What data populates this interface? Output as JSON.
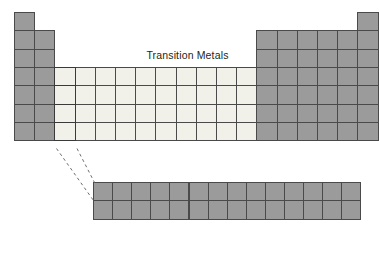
{
  "diagram": {
    "title": "Transition Metals",
    "title_x": 152,
    "title_y": 56,
    "type": "periodic-table-schematic"
  },
  "colors": {
    "main_block_fill": "#9b9b9b",
    "transition_block_fill": "#f1f1e9",
    "cell_border": "#4a4a4a",
    "group3_border": "#3a3a3a",
    "connector_line": "#6e6e6e",
    "background": "#ffffff",
    "title_text": "#231f20"
  },
  "geometry": {
    "main_origin_x": 14,
    "main_origin_y": 12,
    "cell_width": 20.2,
    "cell_height": 18.35,
    "f_block_origin_x": 93,
    "f_block_origin_y": 182,
    "f_block_cell_width": 19.1,
    "f_block_cell_height": 18.35
  },
  "main_table": {
    "columns": 18,
    "rows": 7,
    "column_extents": [
      {
        "group": 1,
        "start_row": 1,
        "end_row": 7,
        "fill": "gray"
      },
      {
        "group": 2,
        "start_row": 2,
        "end_row": 7,
        "fill": "gray"
      },
      {
        "group": 3,
        "start_row": 4,
        "end_row": 7,
        "fill": "light",
        "highlight": true
      },
      {
        "group": 4,
        "start_row": 4,
        "end_row": 7,
        "fill": "light"
      },
      {
        "group": 5,
        "start_row": 4,
        "end_row": 7,
        "fill": "light"
      },
      {
        "group": 6,
        "start_row": 4,
        "end_row": 7,
        "fill": "light"
      },
      {
        "group": 7,
        "start_row": 4,
        "end_row": 7,
        "fill": "light"
      },
      {
        "group": 8,
        "start_row": 4,
        "end_row": 7,
        "fill": "light"
      },
      {
        "group": 9,
        "start_row": 4,
        "end_row": 7,
        "fill": "light"
      },
      {
        "group": 10,
        "start_row": 4,
        "end_row": 7,
        "fill": "light"
      },
      {
        "group": 11,
        "start_row": 4,
        "end_row": 7,
        "fill": "light"
      },
      {
        "group": 12,
        "start_row": 4,
        "end_row": 7,
        "fill": "light"
      },
      {
        "group": 13,
        "start_row": 2,
        "end_row": 7,
        "fill": "gray"
      },
      {
        "group": 14,
        "start_row": 2,
        "end_row": 7,
        "fill": "gray"
      },
      {
        "group": 15,
        "start_row": 2,
        "end_row": 7,
        "fill": "gray"
      },
      {
        "group": 16,
        "start_row": 2,
        "end_row": 7,
        "fill": "gray"
      },
      {
        "group": 17,
        "start_row": 2,
        "end_row": 7,
        "fill": "gray"
      },
      {
        "group": 18,
        "start_row": 1,
        "end_row": 7,
        "fill": "gray"
      }
    ]
  },
  "f_block": {
    "columns": 14,
    "rows": 2,
    "fill": "gray"
  },
  "connector": {
    "style": "dashed",
    "dash_pattern": "3 3",
    "lines": [
      {
        "x1": 56.5,
        "y1": 148.5,
        "x2": 93.5,
        "y2": 200.5
      },
      {
        "x1": 77.0,
        "y1": 148.5,
        "x2": 94.5,
        "y2": 182.5
      }
    ]
  }
}
